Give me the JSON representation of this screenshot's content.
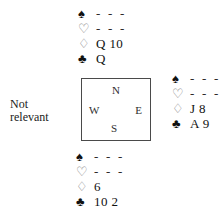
{
  "diagram": {
    "kind": "bridge-hand-diagram",
    "note": {
      "line1": "Not",
      "line2": "relevant"
    },
    "compass": {
      "north": "N",
      "west": "W",
      "east": "E",
      "south": "S"
    },
    "suit_symbols": {
      "spade": "♠",
      "heart": "♡",
      "diamond": "♢",
      "club": "♣"
    },
    "hands": {
      "north": {
        "label": "North",
        "spades": "- - -",
        "hearts": "- - -",
        "diamonds": "Q 10",
        "clubs": "Q"
      },
      "east": {
        "label": "East",
        "spades": "- - -",
        "hearts": "- - -",
        "diamonds": "J 8",
        "clubs": "A 9"
      },
      "south": {
        "label": "South",
        "spades": "- - -",
        "hearts": "- - -",
        "diamonds": "6",
        "clubs": "10 2"
      },
      "west": {
        "label": "West",
        "description": "Not relevant"
      }
    },
    "colors": {
      "ink": "#111111",
      "open_suit": "#7d7d7d",
      "box_border": "#4a4a4a",
      "background": "#ffffff"
    }
  }
}
